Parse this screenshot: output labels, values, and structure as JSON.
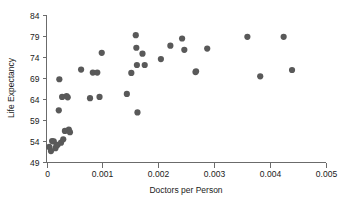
{
  "chart_data": {
    "type": "scatter",
    "title": "",
    "xlabel": "Doctors per Person",
    "ylabel": "Life Expectancy",
    "xlim": [
      0,
      0.005
    ],
    "ylim": [
      49,
      84
    ],
    "grid": false,
    "legend": null,
    "xticks": [
      0,
      0.001,
      0.002,
      0.003,
      0.004,
      0.005
    ],
    "xtick_labels": [
      "0",
      "0.001",
      "0.002",
      "0.003",
      "0.004",
      "0.005"
    ],
    "yticks": [
      49,
      54,
      59,
      64,
      69,
      74,
      79,
      84
    ],
    "ytick_labels": [
      "49",
      "54",
      "59",
      "64",
      "69",
      "74",
      "79",
      "84"
    ],
    "marker": "circle",
    "marker_color": "#595959",
    "marker_size": 3.1,
    "points": [
      {
        "x": 5e-05,
        "y": 52.6
      },
      {
        "x": 8e-05,
        "y": 51.6
      },
      {
        "x": 0.0001,
        "y": 54.0
      },
      {
        "x": 0.00013,
        "y": 53.9
      },
      {
        "x": 0.00016,
        "y": 52.3
      },
      {
        "x": 0.00018,
        "y": 52.9
      },
      {
        "x": 0.0002,
        "y": 53.1
      },
      {
        "x": 0.00022,
        "y": 61.3
      },
      {
        "x": 0.00023,
        "y": 68.7
      },
      {
        "x": 0.00026,
        "y": 53.6
      },
      {
        "x": 0.00028,
        "y": 64.5
      },
      {
        "x": 0.0003,
        "y": 54.4
      },
      {
        "x": 0.00033,
        "y": 56.4
      },
      {
        "x": 0.00036,
        "y": 64.7
      },
      {
        "x": 0.00038,
        "y": 64.4
      },
      {
        "x": 0.0004,
        "y": 56.7
      },
      {
        "x": 0.00042,
        "y": 56.1
      },
      {
        "x": 0.00062,
        "y": 71.0
      },
      {
        "x": 0.00078,
        "y": 64.2
      },
      {
        "x": 0.00083,
        "y": 70.3
      },
      {
        "x": 0.00091,
        "y": 70.3
      },
      {
        "x": 0.00095,
        "y": 64.5
      },
      {
        "x": 0.00099,
        "y": 75.0
      },
      {
        "x": 0.00144,
        "y": 65.2
      },
      {
        "x": 0.00152,
        "y": 70.2
      },
      {
        "x": 0.0016,
        "y": 79.2
      },
      {
        "x": 0.00161,
        "y": 76.2
      },
      {
        "x": 0.00162,
        "y": 72.1
      },
      {
        "x": 0.00163,
        "y": 60.8
      },
      {
        "x": 0.00172,
        "y": 74.8
      },
      {
        "x": 0.00176,
        "y": 72.1
      },
      {
        "x": 0.00205,
        "y": 73.5
      },
      {
        "x": 0.00222,
        "y": 76.7
      },
      {
        "x": 0.00243,
        "y": 78.4
      },
      {
        "x": 0.00247,
        "y": 75.7
      },
      {
        "x": 0.00267,
        "y": 70.4
      },
      {
        "x": 0.00268,
        "y": 70.6
      },
      {
        "x": 0.00288,
        "y": 76.0
      },
      {
        "x": 0.0036,
        "y": 78.8
      },
      {
        "x": 0.00383,
        "y": 69.4
      },
      {
        "x": 0.00425,
        "y": 78.8
      },
      {
        "x": 0.0044,
        "y": 70.9
      }
    ]
  }
}
